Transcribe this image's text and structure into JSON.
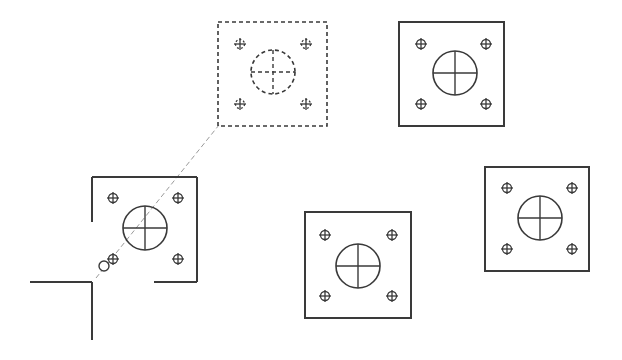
{
  "drawing": {
    "type": "cad-base-plate-copy-illustration",
    "colors": {
      "background": "#ffffff",
      "stroke": "#3a3a3a",
      "leader": "#9a9a9a"
    },
    "plates": [
      {
        "id": "ghost",
        "style": "dashed",
        "x": 218,
        "y": 22,
        "w": 109,
        "h": 104,
        "cx": 273,
        "cy": 72,
        "r": 22,
        "bolts": [
          [
            240,
            44
          ],
          [
            306,
            44
          ],
          [
            240,
            104
          ],
          [
            306,
            104
          ]
        ]
      },
      {
        "id": "top-right",
        "style": "solid",
        "x": 399,
        "y": 22,
        "w": 105,
        "h": 104,
        "cx": 455,
        "cy": 73,
        "r": 22,
        "bolts": [
          [
            421,
            44
          ],
          [
            486,
            44
          ],
          [
            421,
            104
          ],
          [
            486,
            104
          ]
        ]
      },
      {
        "id": "bottom-middle",
        "style": "solid",
        "x": 305,
        "y": 212,
        "w": 106,
        "h": 106,
        "cx": 358,
        "cy": 266,
        "r": 22,
        "bolts": [
          [
            325,
            235
          ],
          [
            392,
            235
          ],
          [
            325,
            296
          ],
          [
            392,
            296
          ]
        ]
      },
      {
        "id": "right",
        "style": "solid",
        "x": 485,
        "y": 167,
        "w": 104,
        "h": 104,
        "cx": 540,
        "cy": 218,
        "r": 22,
        "bolts": [
          [
            507,
            188
          ],
          [
            572,
            188
          ],
          [
            507,
            249
          ],
          [
            572,
            249
          ]
        ]
      }
    ],
    "partial_plate": {
      "id": "source-left",
      "cx": 145,
      "cy": 228,
      "r": 22,
      "bolts": [
        [
          113,
          198
        ],
        [
          178,
          198
        ],
        [
          113,
          259
        ],
        [
          178,
          259
        ]
      ],
      "edges": [
        [
          92,
          177,
          197,
          177
        ],
        [
          197,
          177,
          197,
          282
        ],
        [
          154,
          282,
          197,
          282
        ],
        [
          92,
          177,
          92,
          222
        ]
      ]
    },
    "corner_lines": [
      [
        30,
        282,
        92,
        282
      ],
      [
        92,
        282,
        92,
        340
      ]
    ],
    "leader_line": [
      96,
      278,
      219,
      125
    ],
    "cursor_marker": {
      "x": 104,
      "y": 266,
      "r": 5
    }
  }
}
